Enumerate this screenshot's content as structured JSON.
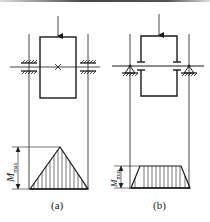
{
  "figure": {
    "colors": {
      "stroke": "#1a1a1a",
      "top_rule_dark": "#555555",
      "top_rule_light": "#dddddd",
      "background": "#ffffff"
    },
    "panels": [
      {
        "id": "a",
        "caption": "(a)",
        "description": "Shaft with single central gear/wheel supported by two fixed (clamped) bearings; central load applied from above",
        "moment_diagram": {
          "shape": "triangle",
          "label_symbol": "M",
          "label_subscript": "max"
        }
      },
      {
        "id": "b",
        "caption": "(b)",
        "description": "Shaft with frame (two-point) hub supported by two pin supports; load applied at top of frame",
        "moment_diagram": {
          "shape": "trapezoid",
          "label_symbol": "M",
          "label_subscript": "max"
        }
      }
    ]
  }
}
